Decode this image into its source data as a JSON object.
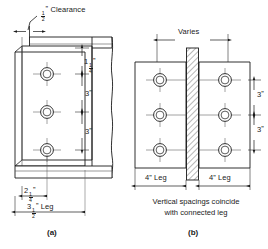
{
  "figure": {
    "panels": [
      {
        "id": "a",
        "caption": "(a)",
        "callout": {
          "label_whole": "",
          "label_num": "1",
          "label_den": "2",
          "unit": "”",
          "text": "Clearance"
        },
        "vertical_dims": [
          {
            "whole": "1",
            "num": "1",
            "den": "4",
            "unit": "”"
          },
          {
            "whole": "3",
            "num": "",
            "den": "",
            "unit": "”"
          },
          {
            "whole": "3",
            "num": "",
            "den": "",
            "unit": "”"
          }
        ],
        "horizontal_dims": [
          {
            "whole": "2",
            "num": "1",
            "den": "4",
            "unit": "”",
            "text": ""
          },
          {
            "whole": "3",
            "num": "1",
            "den": "2",
            "unit": "”",
            "text": " Leg"
          }
        ],
        "bolt_count": 3
      },
      {
        "id": "b",
        "caption": "(b)",
        "top_dim": "Varies",
        "vertical_dims": [
          {
            "whole": "3",
            "unit": "”"
          },
          {
            "whole": "3",
            "unit": "”"
          }
        ],
        "leg_labels": [
          "4” Leg",
          "4” Leg"
        ],
        "note_line1": "Vertical spacings coincide",
        "note_line2": "with connected leg",
        "bolt_count_per_side": 3
      }
    ]
  },
  "colors": {
    "line": "#1a1a1a",
    "thin_line": "#555555",
    "background": "#ffffff",
    "hatch": "#333333"
  }
}
